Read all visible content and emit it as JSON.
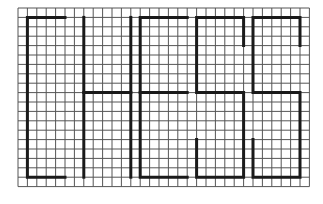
{
  "figure": {
    "word": "CHESS",
    "grid": {
      "cols": 31,
      "rows": 19,
      "origin_x": 18,
      "origin_y": 8,
      "cell": 9.4
    },
    "colors": {
      "background": "#ffffff",
      "grid_line": "#555555",
      "stroke": "#1a1a1a"
    },
    "letters": [
      {
        "char": "C",
        "path": [
          [
            5,
            1
          ],
          [
            1,
            1
          ],
          [
            1,
            18
          ],
          [
            5,
            18
          ]
        ]
      },
      {
        "char": "H",
        "path": [
          [
            7,
            1
          ],
          [
            7,
            18
          ]
        ],
        "extra": [
          [
            [
              7,
              9
            ],
            [
              12,
              9
            ]
          ],
          [
            [
              12,
              1
            ],
            [
              12,
              18
            ]
          ]
        ]
      },
      {
        "char": "E",
        "path": [
          [
            18,
            1
          ],
          [
            13,
            1
          ],
          [
            13,
            18
          ],
          [
            18,
            18
          ]
        ],
        "extra": [
          [
            [
              13,
              9
            ],
            [
              18,
              9
            ]
          ]
        ]
      },
      {
        "char": "S",
        "path": [
          [
            24,
            4
          ],
          [
            24,
            1
          ],
          [
            19,
            1
          ],
          [
            19,
            9
          ],
          [
            24,
            9
          ],
          [
            24,
            18
          ],
          [
            19,
            18
          ],
          [
            19,
            14
          ]
        ]
      },
      {
        "char": "S",
        "path": [
          [
            30,
            4
          ],
          [
            30,
            1
          ],
          [
            25,
            1
          ],
          [
            25,
            9
          ],
          [
            30,
            9
          ],
          [
            30,
            18
          ],
          [
            25,
            18
          ],
          [
            25,
            14
          ]
        ]
      }
    ]
  }
}
